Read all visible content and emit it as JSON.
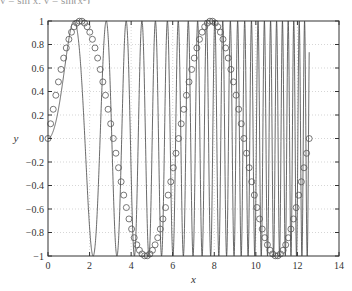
{
  "top_text": "y = sin x, y = sin(x²)",
  "chart_data": {
    "type": "line",
    "title": "",
    "xlabel": "x",
    "ylabel": "y",
    "xlim": [
      0,
      14
    ],
    "ylim": [
      -1,
      1
    ],
    "xticks": [
      0,
      2,
      4,
      6,
      8,
      10,
      12,
      14
    ],
    "yticks": [
      -1,
      -0.8,
      -0.6,
      -0.4,
      -0.2,
      0,
      0.2,
      0.4,
      0.6,
      0.8,
      1
    ],
    "ytick_labels": [
      "-1",
      "-0.8",
      "-0.6",
      "-0.4",
      "-0.2",
      "0",
      "0.2",
      "0.4",
      "0.6",
      "0.8",
      "1"
    ],
    "grid": true,
    "grid_style": "dotted",
    "legend": false,
    "series": [
      {
        "name": "sin(x)",
        "style": "markers",
        "marker": "open-circle",
        "function": "sin(x)",
        "x_range": [
          0,
          12.566
        ],
        "num_points": 101,
        "color": "#555555"
      },
      {
        "name": "sin(x^2)",
        "style": "line",
        "function": "sin(x^2)",
        "x_range": [
          0,
          12.566
        ],
        "num_points": 101,
        "color": "#444444"
      }
    ]
  },
  "layout": {
    "plot_left": 48,
    "plot_top": 21,
    "plot_right": 339,
    "plot_bottom": 256
  }
}
